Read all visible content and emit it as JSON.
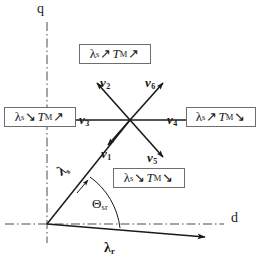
{
  "figure": {
    "background_color": "#ffffff",
    "line_color": "#1a1a1a",
    "box_border_color": "#6e6e6e",
    "axis_line_style": "dash-dot"
  },
  "axes": {
    "horizontal": {
      "label": "d",
      "name": "d-axis"
    },
    "vertical": {
      "label": "q",
      "name": "q-axis"
    }
  },
  "vectors": [
    {
      "id": "v1",
      "base": "v",
      "subscript": "1",
      "label": "v1",
      "angle_deg": 240
    },
    {
      "id": "v2",
      "base": "v",
      "subscript": "2",
      "label": "v2",
      "angle_deg": 120
    },
    {
      "id": "v3",
      "base": "v",
      "subscript": "3",
      "label": "v3",
      "angle_deg": 180
    },
    {
      "id": "v4",
      "base": "v",
      "subscript": "4",
      "label": "v4",
      "angle_deg": 0
    },
    {
      "id": "v5",
      "base": "v",
      "subscript": "5",
      "label": "v5",
      "angle_deg": 300
    },
    {
      "id": "v6",
      "base": "v",
      "subscript": "6",
      "label": "v6",
      "angle_deg": 60
    }
  ],
  "flux_vectors": {
    "stator": {
      "base": "λ",
      "subscript": "s",
      "label": "λs"
    },
    "rotor": {
      "base": "λ",
      "subscript": "r",
      "label": "λr"
    }
  },
  "angle": {
    "base": "Θ",
    "subscript": "sr",
    "label": "Θsr"
  },
  "boxes": [
    {
      "id": "box-top",
      "position": "top",
      "flux_symbol": "λ",
      "flux_sub": "s",
      "flux_arrow": "↗",
      "torque_symbol": "T",
      "torque_sub": "M",
      "torque_arrow": "↗",
      "text": "λs ↗ TM ↗"
    },
    {
      "id": "box-left",
      "position": "left",
      "flux_symbol": "λ",
      "flux_sub": "s",
      "flux_arrow": "↘",
      "torque_symbol": "T",
      "torque_sub": "M",
      "torque_arrow": "↗",
      "text": "λs ↘ TM ↗"
    },
    {
      "id": "box-right",
      "position": "right",
      "flux_symbol": "λ",
      "flux_sub": "s",
      "flux_arrow": "↗",
      "torque_symbol": "T",
      "torque_sub": "M",
      "torque_arrow": "↘",
      "text": "λs ↗ TM ↘"
    },
    {
      "id": "box-bottom",
      "position": "bottom",
      "flux_symbol": "λ",
      "flux_sub": "s",
      "flux_arrow": "↘",
      "torque_symbol": "T",
      "torque_sub": "M",
      "torque_arrow": "↘",
      "text": "λs ↘ TM ↘"
    }
  ]
}
